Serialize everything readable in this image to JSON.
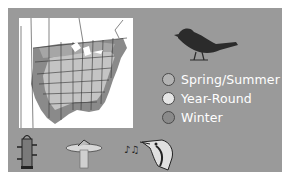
{
  "legend": {
    "items": [
      {
        "label": "Spring/Summer",
        "color": "#b3b3b3"
      },
      {
        "label": "Year-Round",
        "color": "#e6e6e6"
      },
      {
        "label": "Winter",
        "color": "#8a8a8a"
      }
    ]
  },
  "colors": {
    "panel": "#9a9a9a",
    "map_background": "#ffffff",
    "year_round": "#c8c8c8",
    "spring_summer": "#a8a8a8",
    "winter": "#8a8a8a",
    "bird": "#2b2b2b"
  },
  "icons": {
    "bird": "bird-silhouette-icon",
    "feeder": "tube-feeder-icon",
    "birdbath": "birdbath-icon",
    "song": "music-notes-icon",
    "head": "bird-head-icon"
  }
}
